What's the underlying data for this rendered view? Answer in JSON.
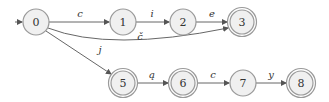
{
  "diagram": {
    "type": "finite-state-automaton",
    "start_state": "0",
    "nodes": [
      {
        "id": "0",
        "label": "0",
        "accepting": false,
        "x": 36,
        "y": 22
      },
      {
        "id": "1",
        "label": "1",
        "accepting": false,
        "x": 123,
        "y": 22
      },
      {
        "id": "2",
        "label": "2",
        "accepting": false,
        "x": 183,
        "y": 22
      },
      {
        "id": "3",
        "label": "3",
        "accepting": true,
        "x": 242,
        "y": 22
      },
      {
        "id": "5",
        "label": "5",
        "accepting": true,
        "x": 123,
        "y": 83
      },
      {
        "id": "6",
        "label": "6",
        "accepting": true,
        "x": 183,
        "y": 83
      },
      {
        "id": "7",
        "label": "7",
        "accepting": false,
        "x": 243,
        "y": 83
      },
      {
        "id": "8",
        "label": "8",
        "accepting": true,
        "x": 301,
        "y": 83
      }
    ],
    "edges": [
      {
        "from": "0",
        "to": "1",
        "label": "c"
      },
      {
        "from": "1",
        "to": "2",
        "label": "i"
      },
      {
        "from": "2",
        "to": "3",
        "label": "e"
      },
      {
        "from": "0",
        "to": "3",
        "label": "č"
      },
      {
        "from": "0",
        "to": "5",
        "label": "j"
      },
      {
        "from": "5",
        "to": "6",
        "label": "ą"
      },
      {
        "from": "6",
        "to": "7",
        "label": "c"
      },
      {
        "from": "7",
        "to": "8",
        "label": "y"
      }
    ]
  }
}
